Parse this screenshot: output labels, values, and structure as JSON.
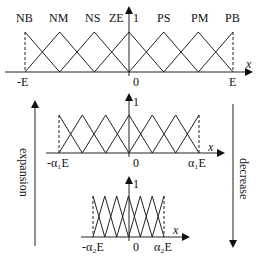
{
  "top_chart": {
    "sets": [
      "NB",
      "NM",
      "NS",
      "ZE",
      "PS",
      "PM",
      "PB"
    ],
    "y_tick": "1",
    "x_label": "x",
    "left_label": "-E",
    "origin_label": "0",
    "right_label": "E"
  },
  "middle_chart": {
    "y_tick": "1",
    "x_label": "x",
    "left_label": "-α₁E",
    "origin_label": "0",
    "right_label": "α₁E"
  },
  "bottom_chart": {
    "y_tick": "1",
    "x_label": "x",
    "left_label": "-α₂E",
    "origin_label": "0",
    "right_label": "α₂E"
  },
  "arrows": {
    "left": "expansion",
    "right": "decrease"
  },
  "colors": {
    "line": "#222222",
    "background": "#ffffff"
  }
}
